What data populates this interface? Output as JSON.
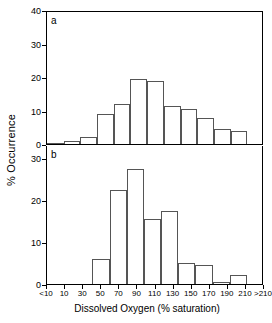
{
  "figure": {
    "ylabel": "% Occurrence",
    "xlabel": "Dissolved Oxygen (% saturation)",
    "panel_a_label": "a",
    "panel_b_label": "b"
  },
  "chart_data": [
    {
      "type": "bar",
      "panel": "a",
      "title": "",
      "xlabel": "Dissolved Oxygen (% saturation)",
      "ylabel": "% Occurrence",
      "categories": [
        "<10",
        "10",
        "30",
        "50",
        "70",
        "90",
        "110",
        "130",
        "150",
        "170",
        "190",
        "210",
        ">210"
      ],
      "values": [
        0.4,
        1.0,
        2.0,
        9.0,
        12.2,
        19.6,
        19.1,
        11.6,
        10.7,
        7.8,
        4.7,
        4.0,
        0
      ],
      "ylim": [
        0,
        40
      ],
      "yticks": [
        0,
        10,
        20,
        30,
        40
      ],
      "ytick_labels": [
        "0",
        "10",
        "20",
        "30",
        "40"
      ],
      "grid": false,
      "legend": "none"
    },
    {
      "type": "bar",
      "panel": "b",
      "title": "",
      "xlabel": "Dissolved Oxygen (% saturation)",
      "ylabel": "% Occurrence",
      "categories": [
        "<10",
        "10",
        "30",
        "50",
        "70",
        "90",
        "110",
        "130",
        "150",
        "170",
        "190",
        "210",
        ">210"
      ],
      "values": [
        0,
        0,
        0,
        6.0,
        22.5,
        27.5,
        15.5,
        17.5,
        5.0,
        4.5,
        0.6,
        2.2,
        0
      ],
      "ylim": [
        0,
        33
      ],
      "yticks": [
        0,
        10,
        20,
        30
      ],
      "ytick_labels": [
        "0",
        "10",
        "20",
        "30"
      ],
      "grid": false,
      "legend": "none"
    }
  ],
  "axis": {
    "a_ticks": [
      "40",
      "30",
      "20",
      "10",
      "0"
    ],
    "b_ticks": [
      "30",
      "20",
      "10",
      "0"
    ],
    "x_labels": [
      "<10",
      "10",
      "30",
      "50",
      "70",
      "90",
      "110",
      "130",
      "150",
      "170",
      "190",
      "210",
      ">210"
    ]
  },
  "colors": {
    "axis": "#000000",
    "bar_outline": "#555555",
    "background": "#ffffff"
  }
}
